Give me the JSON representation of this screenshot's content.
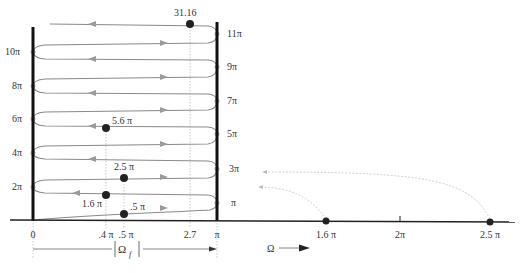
{
  "figure": {
    "colors": {
      "axis": "#111111",
      "path": "#8a8a8a",
      "path_arrow": "#9a9a9a",
      "dotted_guide": "#c0c0c0",
      "fold_arrow": "#d0d0d0",
      "point": "#222222",
      "text": "#333333"
    },
    "left_labels": [
      {
        "text": "10π",
        "y": 52
      },
      {
        "text": "8π",
        "y": 86
      },
      {
        "text": "6π",
        "y": 119
      },
      {
        "text": "4π",
        "y": 153
      },
      {
        "text": "2π",
        "y": 187
      }
    ],
    "right_labels": [
      {
        "text": "11π",
        "y": 34
      },
      {
        "text": "9π",
        "y": 67
      },
      {
        "text": "7π",
        "y": 101
      },
      {
        "text": "5π",
        "y": 134
      },
      {
        "text": "3π",
        "y": 169
      },
      {
        "text": "π",
        "y": 203
      }
    ],
    "axis_ticks": [
      {
        "text": "0",
        "x": 33
      },
      {
        "text": ".4 π",
        "x": 106
      },
      {
        "text": ".5 π",
        "x": 124
      },
      {
        "text": "2.7",
        "x": 190
      },
      {
        "text": "π",
        "x": 217
      },
      {
        "text": "1.6 π",
        "x": 326
      },
      {
        "text": "2π",
        "x": 400
      },
      {
        "text": "2.5 π",
        "x": 490
      }
    ],
    "point_labels": {
      "p31": "31.16",
      "p56": "5.6 π",
      "p25": "2.5 π",
      "p16": "1.6 π",
      "p05": ".5 π"
    },
    "omega_label": "Ω",
    "omega_f_label": "Ω",
    "omega_f_sub": "f",
    "caption": "Fig. 5.18  Folding of frequency about π"
  }
}
